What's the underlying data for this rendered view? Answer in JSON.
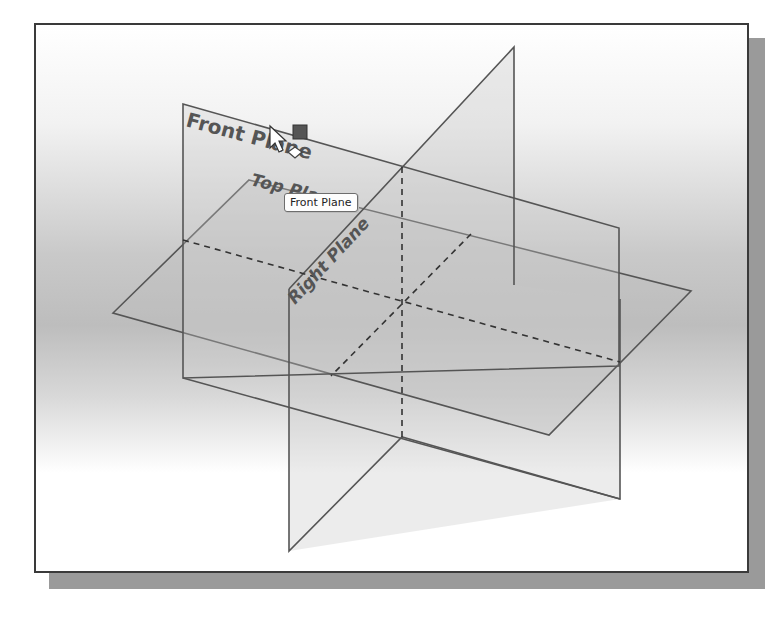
{
  "viewport": {
    "frame_color": "#3a3a3a",
    "shadow_color": "#9a9a9a",
    "background": "grey-white gradient"
  },
  "planes": [
    {
      "name": "Front Plane",
      "label": "Front Plane"
    },
    {
      "name": "Top Plane",
      "label": "Top Plane"
    },
    {
      "name": "Right Plane",
      "label": "Right Plane"
    }
  ],
  "tooltip": {
    "text": "Front Plane"
  },
  "cursor": {
    "icon": "arrow-cursor-icon",
    "badge": "plane-select-icon"
  }
}
